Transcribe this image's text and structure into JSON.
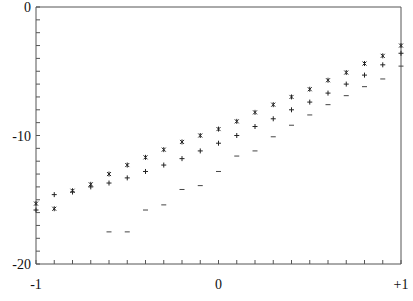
{
  "chart_data": {
    "type": "scatter",
    "title": "",
    "xlabel": "",
    "ylabel": "",
    "xlim": [
      -1,
      1
    ],
    "ylim": [
      -20,
      0
    ],
    "grid": false,
    "legend": null,
    "x_ticks": [
      {
        "value": -1,
        "label": "-1"
      },
      {
        "value": 0,
        "label": "0"
      },
      {
        "value": 1,
        "label": "+1"
      }
    ],
    "y_ticks": [
      {
        "value": 0,
        "label": "0"
      },
      {
        "value": -10,
        "label": "-10"
      },
      {
        "value": -20,
        "label": "-20"
      }
    ],
    "minor_x_step": 0.1,
    "minor_y_step": 1,
    "series": [
      {
        "name": "series-asterisk",
        "marker": "*",
        "x": [
          -1.0,
          -0.9,
          -0.8,
          -0.7,
          -0.6,
          -0.5,
          -0.4,
          -0.3,
          -0.2,
          -0.1,
          0.0,
          0.1,
          0.2,
          0.3,
          0.4,
          0.5,
          0.6,
          0.7,
          0.8,
          0.9,
          1.0
        ],
        "values": [
          -15.3,
          -15.7,
          -14.3,
          -13.8,
          -13.0,
          -12.3,
          -11.7,
          -11.1,
          -10.5,
          -10.0,
          -9.5,
          -8.9,
          -8.2,
          -7.6,
          -7.0,
          -6.4,
          -5.7,
          -5.1,
          -4.4,
          -3.8,
          -3.0
        ]
      },
      {
        "name": "series-plus",
        "marker": "+",
        "x": [
          -1.0,
          -0.9,
          -0.8,
          -0.7,
          -0.6,
          -0.5,
          -0.4,
          -0.3,
          -0.2,
          -0.1,
          0.0,
          0.1,
          0.2,
          0.3,
          0.4,
          0.5,
          0.6,
          0.7,
          0.8,
          0.9,
          1.0
        ],
        "values": [
          -15.8,
          -14.6,
          -14.4,
          -14.0,
          -13.7,
          -13.3,
          -12.8,
          -12.3,
          -11.8,
          -11.2,
          -10.6,
          -10.0,
          -9.3,
          -8.7,
          -8.0,
          -7.4,
          -6.7,
          -6.0,
          -5.3,
          -4.5,
          -3.6
        ]
      },
      {
        "name": "series-dash",
        "marker": "-",
        "x": [
          -0.6,
          -0.5,
          -0.4,
          -0.3,
          -0.2,
          -0.1,
          0.0,
          0.1,
          0.2,
          0.3,
          0.4,
          0.5,
          0.6,
          0.7,
          0.8,
          0.9,
          1.0
        ],
        "values": [
          -17.5,
          -17.5,
          -15.8,
          -15.4,
          -14.2,
          -13.9,
          -12.8,
          -11.6,
          -11.2,
          -10.1,
          -9.2,
          -8.4,
          -7.6,
          -6.9,
          -6.2,
          -5.6,
          -4.6
        ]
      }
    ]
  }
}
